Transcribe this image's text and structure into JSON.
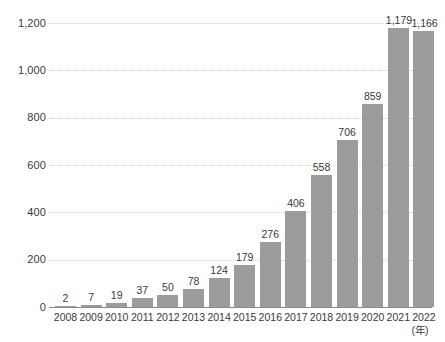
{
  "chart_data": {
    "type": "bar",
    "title": "",
    "xlabel": "(年)",
    "ylabel": "",
    "ylim": [
      0,
      1200
    ],
    "grid": true,
    "legend": "none",
    "categories": [
      "2008",
      "2009",
      "2010",
      "2011",
      "2012",
      "2013",
      "2014",
      "2015",
      "2016",
      "2017",
      "2018",
      "2019",
      "2020",
      "2021",
      "2022"
    ],
    "values": [
      2,
      7,
      19,
      37,
      50,
      78,
      124,
      179,
      276,
      406,
      558,
      706,
      859,
      1179,
      1166
    ],
    "value_labels": [
      "2",
      "7",
      "19",
      "37",
      "50",
      "78",
      "124",
      "179",
      "276",
      "406",
      "558",
      "706",
      "859",
      "1,179",
      "1,166"
    ],
    "y_ticks": [
      0,
      200,
      400,
      600,
      800,
      1000,
      1200
    ],
    "y_tick_labels": [
      "0",
      "200",
      "400",
      "600",
      "800",
      "1,000",
      "1,200"
    ],
    "colors": {
      "bar": "#9c9c9c",
      "gridline": "#d2d2d2",
      "axis": "#8c8c8c",
      "text": "#3a3a3a",
      "background": "#ffffff"
    }
  }
}
